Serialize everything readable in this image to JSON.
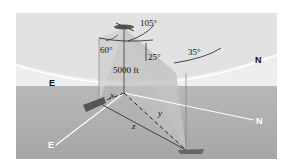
{
  "diagram": {
    "type": "3d-geometry-figure",
    "angles": {
      "a105": "105°",
      "a60": "60°",
      "a25": "25°",
      "a35": "35°"
    },
    "altitude_label": "5000 ft",
    "directions": {
      "east_sky": "E",
      "north_sky": "N",
      "east_ground": "E",
      "north_ground": "N"
    },
    "distances": {
      "x": "x",
      "y": "y",
      "z": "z"
    },
    "colors": {
      "sky": "#ececec",
      "ground": "#a9a9a9",
      "planes": "#c4c4c4",
      "lines": "#3a3a3a",
      "axis_white": "#ffffff"
    }
  }
}
